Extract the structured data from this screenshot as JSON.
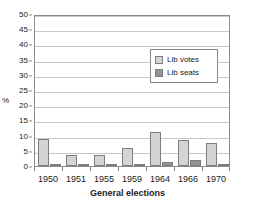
{
  "chart_data": {
    "type": "bar",
    "title": "",
    "xlabel": "General elections",
    "ylabel": "%",
    "categories": [
      "1950",
      "1951",
      "1955",
      "1959",
      "1964",
      "1966",
      "1970"
    ],
    "series": [
      {
        "name": "Lib votes",
        "color": "#d4d4d4",
        "values": [
          9.0,
          3.6,
          3.6,
          6.0,
          11.2,
          8.6,
          7.6
        ]
      },
      {
        "name": "Lib seats",
        "color": "#939393",
        "values": [
          0.7,
          0.8,
          0.8,
          0.4,
          1.4,
          2.0,
          0.8
        ]
      }
    ],
    "ylim": [
      0,
      50
    ],
    "yticks": [
      0,
      5,
      10,
      15,
      20,
      25,
      30,
      35,
      40,
      45,
      50
    ],
    "ytick_labels": [
      "0",
      "5",
      "10",
      "15",
      "20",
      "25",
      "30",
      "35",
      "40",
      "45",
      "50"
    ],
    "grid": true,
    "grid_axis": "y",
    "legend_position": "upper right",
    "legend_entries": [
      "Lib votes",
      "Lib seats"
    ],
    "plot_border_color": "#8a8a8a",
    "gridline_color": "#c8c8c8",
    "background_color": "#ffffff",
    "text_color": "#1a1a1a"
  }
}
